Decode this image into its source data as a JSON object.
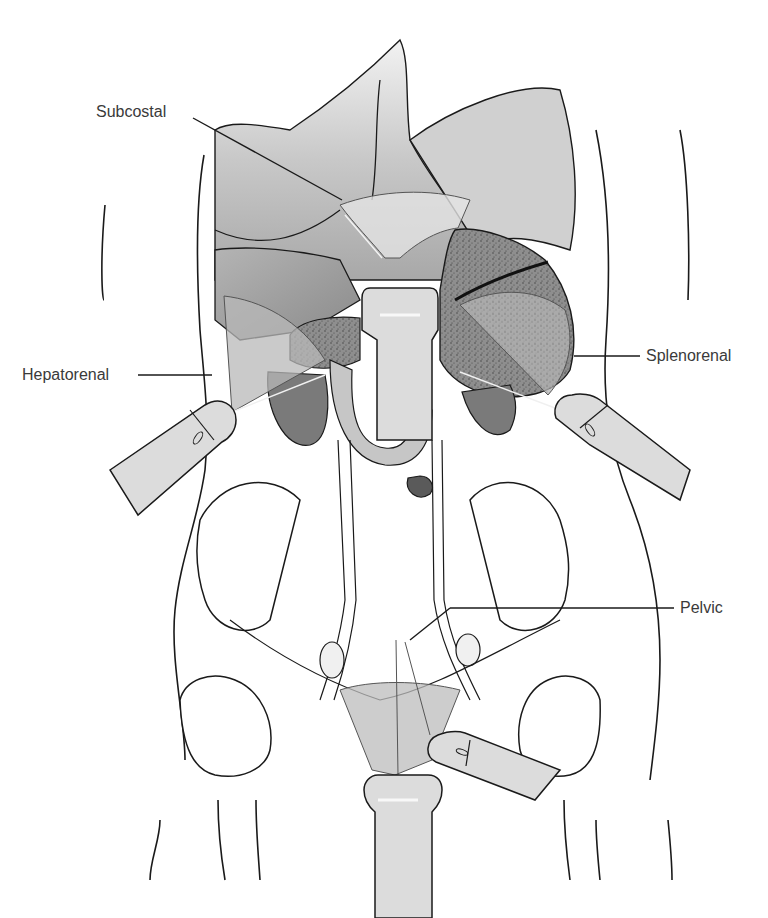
{
  "figure": {
    "labels": {
      "subcostal": "Subcostal",
      "hepatorenal": "Hepatorenal",
      "splenorenal": "Splenorenal",
      "pelvic": "Pelvic"
    },
    "colors": {
      "outline": "#1a1a1a",
      "organ_dark": "#7a7a7a",
      "organ_mid": "#9c9c9c",
      "organ_light": "#c4c4c4",
      "scan_fan": "#d8d8d8",
      "probe": "#dcdcdc",
      "label_text": "#3a3a3a",
      "background": "#ffffff"
    }
  }
}
